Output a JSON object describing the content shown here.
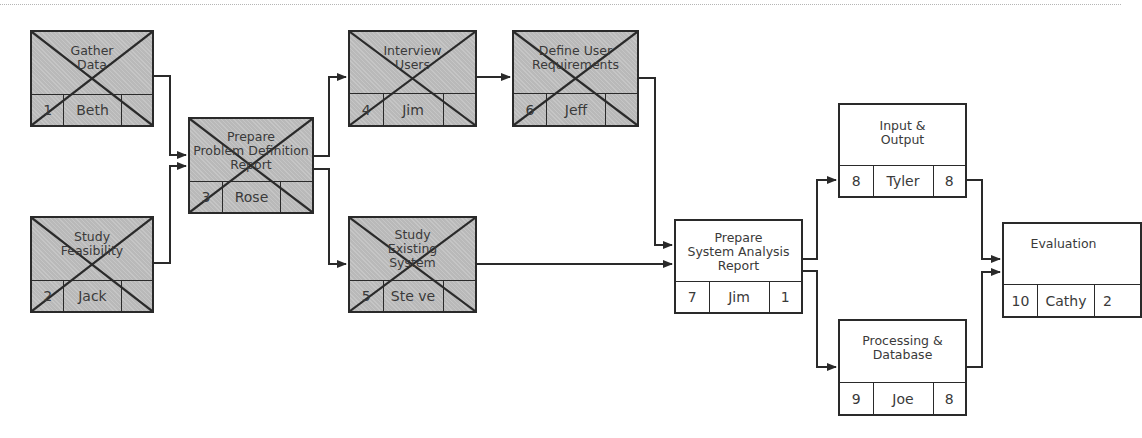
{
  "diagram": {
    "type": "network-diagram",
    "completed_marker": "x-cross",
    "colors": {
      "completed_fill": "#b9b9b9",
      "pending_fill": "#ffffff",
      "line": "#2a2a2a"
    },
    "nodes": [
      {
        "id": 1,
        "title": [
          "Gather",
          "Data"
        ],
        "number": "1",
        "person": "Beth",
        "duration": "",
        "completed": true
      },
      {
        "id": 2,
        "title": [
          "Study",
          "Feasibility"
        ],
        "number": "2",
        "person": "Jack",
        "duration": "",
        "completed": true
      },
      {
        "id": 3,
        "title": [
          "Prepare",
          "Problem Definition",
          "Report"
        ],
        "number": "3",
        "person": "Rose",
        "duration": "",
        "completed": true
      },
      {
        "id": 4,
        "title": [
          "Interview",
          "Users"
        ],
        "number": "4",
        "person": "Jim",
        "duration": "",
        "completed": true
      },
      {
        "id": 5,
        "title": [
          "Study",
          "Existing",
          "System"
        ],
        "number": "5",
        "person": "Ste ve",
        "duration": "",
        "completed": true
      },
      {
        "id": 6,
        "title": [
          "Define User",
          "Requirements"
        ],
        "number": "6",
        "person": "Jeff",
        "duration": "",
        "completed": true
      },
      {
        "id": 7,
        "title": [
          "Prepare",
          "System Analysis",
          "Report"
        ],
        "number": "7",
        "person": "Jim",
        "duration": "1",
        "completed": false
      },
      {
        "id": 8,
        "title": [
          "Input &",
          "Output"
        ],
        "number": "8",
        "person": "Tyler",
        "duration": "8",
        "completed": false
      },
      {
        "id": 9,
        "title": [
          "Processing &",
          "Database"
        ],
        "number": "9",
        "person": "Joe",
        "duration": "8",
        "completed": false
      },
      {
        "id": 10,
        "title": [
          "Evaluation"
        ],
        "number": "10",
        "person": "Cathy",
        "duration": "2",
        "completed": false
      }
    ],
    "edges": [
      [
        1,
        3
      ],
      [
        2,
        3
      ],
      [
        3,
        4
      ],
      [
        3,
        5
      ],
      [
        4,
        6
      ],
      [
        6,
        7
      ],
      [
        5,
        7
      ],
      [
        7,
        8
      ],
      [
        7,
        9
      ],
      [
        8,
        10
      ],
      [
        9,
        10
      ]
    ]
  }
}
